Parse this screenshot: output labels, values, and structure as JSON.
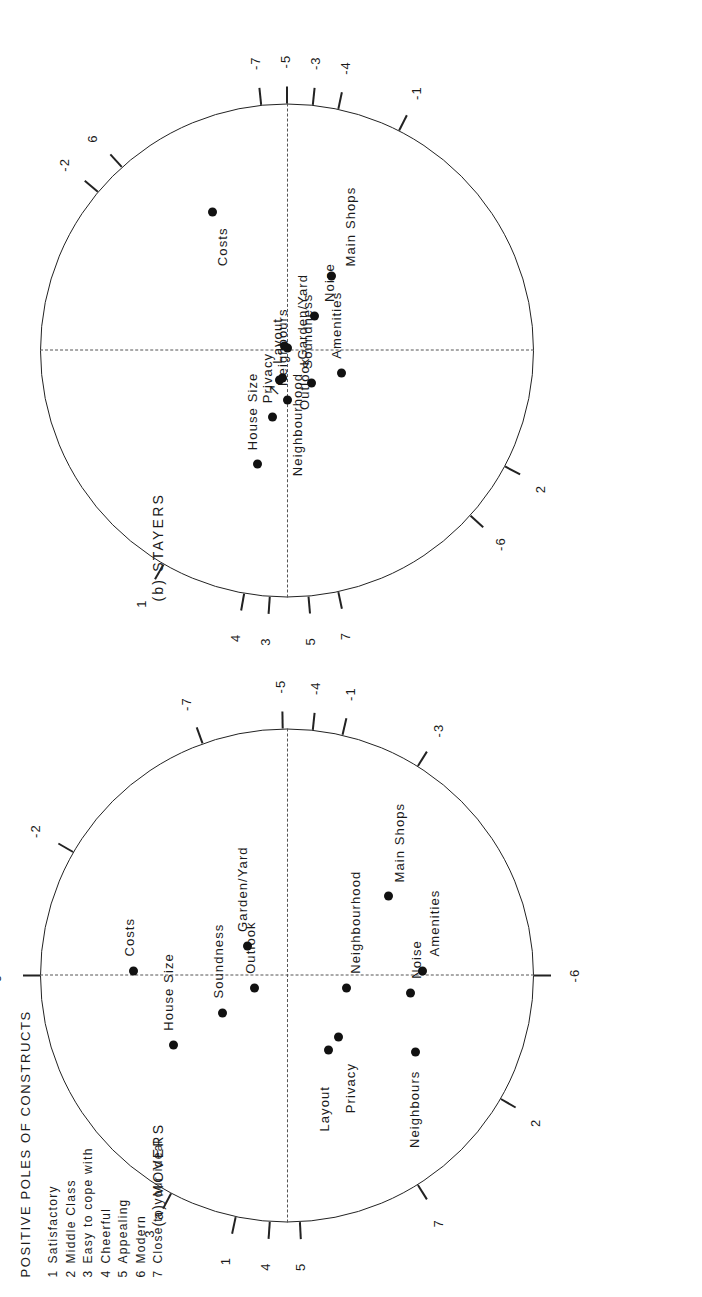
{
  "figure": {
    "legend_title": "POSITIVE POLES OF CONSTRUCTS",
    "legend_items": [
      {
        "num": "1",
        "label": "Satisfactory"
      },
      {
        "num": "2",
        "label": "Middle Class"
      },
      {
        "num": "3",
        "label": "Easy to cope with"
      },
      {
        "num": "4",
        "label": "Cheerful"
      },
      {
        "num": "5",
        "label": "Appealing"
      },
      {
        "num": "6",
        "label": "Modern"
      },
      {
        "num": "7",
        "label": "Close to your ideal"
      }
    ],
    "panels": [
      {
        "id": "movers",
        "title": "(a) MOVERS",
        "ticks": [
          {
            "label": "3",
            "angle": 152
          },
          {
            "label": "1",
            "angle": 168
          },
          {
            "label": "4",
            "angle": 176
          },
          {
            "label": "5",
            "angle": 183
          },
          {
            "label": "7",
            "angle": 212
          },
          {
            "label": "2",
            "angle": 240
          },
          {
            "label": "-6",
            "angle": 270
          },
          {
            "label": "6",
            "angle": 90
          },
          {
            "label": "-2",
            "angle": 60
          },
          {
            "label": "-7",
            "angle": 20
          },
          {
            "label": "-5",
            "angle": 1
          },
          {
            "label": "-4",
            "angle": -6
          },
          {
            "label": "-1",
            "angle": -13
          },
          {
            "label": "-3",
            "angle": -32
          }
        ],
        "points": [
          {
            "name": "House Size",
            "x": -0.28,
            "y": 0.46,
            "label_dx": 14,
            "label_dy": -4
          },
          {
            "name": "Soundness",
            "x": -0.15,
            "y": 0.26,
            "label_dx": 14,
            "label_dy": -4
          },
          {
            "name": "Outlook",
            "x": -0.05,
            "y": 0.13,
            "label_dx": 14,
            "label_dy": -4
          },
          {
            "name": "Costs",
            "x": 0.02,
            "y": 0.62,
            "label_dx": 14,
            "label_dy": -4
          },
          {
            "name": "Garden/Yard",
            "x": 0.12,
            "y": 0.16,
            "label_dx": 14,
            "label_dy": -4
          },
          {
            "name": "Layout",
            "x": -0.3,
            "y": -0.17,
            "label_dx": -82,
            "label_dy": -4
          },
          {
            "name": "Privacy",
            "x": -0.25,
            "y": -0.21,
            "label_dx": -76,
            "label_dy": 12
          },
          {
            "name": "Neighbourhood",
            "x": -0.05,
            "y": -0.24,
            "label_dx": 14,
            "label_dy": 10
          },
          {
            "name": "Neighbours",
            "x": -0.31,
            "y": -0.52,
            "label_dx": -96,
            "label_dy": 0
          },
          {
            "name": "Noise",
            "x": -0.07,
            "y": -0.5,
            "label_dx": 14,
            "label_dy": 6
          },
          {
            "name": "Amenities",
            "x": 0.02,
            "y": -0.55,
            "label_dx": 14,
            "label_dy": 12
          },
          {
            "name": "Main Shops",
            "x": 0.32,
            "y": -0.41,
            "label_dx": 14,
            "label_dy": 12
          }
        ]
      },
      {
        "id": "stayers",
        "title": "(b) STAYERS",
        "ticks": [
          {
            "label": "1",
            "angle": 150
          },
          {
            "label": "4",
            "angle": 170
          },
          {
            "label": "3",
            "angle": 176
          },
          {
            "label": "5",
            "angle": 185
          },
          {
            "label": "7",
            "angle": 192
          },
          {
            "label": "-6",
            "angle": 228
          },
          {
            "label": "2",
            "angle": 242
          },
          {
            "label": "-1",
            "angle": 333
          },
          {
            "label": "-4",
            "angle": 348
          },
          {
            "label": "-3",
            "angle": 354
          },
          {
            "label": "-5",
            "angle": 0
          },
          {
            "label": "-7",
            "angle": 6
          },
          {
            "label": "6",
            "angle": 42
          },
          {
            "label": "-2",
            "angle": 50
          }
        ],
        "points": [
          {
            "name": "House Size",
            "x": -0.46,
            "y": 0.12,
            "label_dx": 14,
            "label_dy": -4
          },
          {
            "name": "Privacy",
            "x": -0.27,
            "y": 0.06,
            "label_dx": 14,
            "label_dy": -4
          },
          {
            "name": "Neighbours",
            "x": -0.2,
            "y": 0.0,
            "label_dx": 14,
            "label_dy": -4
          },
          {
            "name": "Layout",
            "x": -0.11,
            "y": 0.02,
            "label_dx": 14,
            "label_dy": -4
          },
          {
            "name": "Soundness",
            "x": -0.13,
            "y": -0.1,
            "label_dx": 14,
            "label_dy": -4
          },
          {
            "name": "Amenities",
            "x": -0.09,
            "y": -0.22,
            "label_dx": 14,
            "label_dy": -4
          },
          {
            "name": "Neighbourhood",
            "x": -0.12,
            "y": 0.03,
            "label_dx": -96,
            "label_dy": 18
          },
          {
            "name": "Outlook",
            "x": 0.01,
            "y": 0.0,
            "label_dx": -62,
            "label_dy": 18
          },
          {
            "name": "Garden/Yard",
            "x": 0.02,
            "y": 0.01,
            "label_dx": -14,
            "label_dy": 18
          },
          {
            "name": "Noise",
            "x": 0.14,
            "y": -0.11,
            "label_dx": 14,
            "label_dy": 16
          },
          {
            "name": "Main Shops",
            "x": 0.3,
            "y": -0.18,
            "label_dx": 10,
            "label_dy": 20
          },
          {
            "name": "Costs",
            "x": 0.56,
            "y": 0.3,
            "label_dx": -54,
            "label_dy": 10
          }
        ],
        "arrow": "↗"
      }
    ]
  }
}
